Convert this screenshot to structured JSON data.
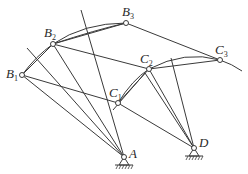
{
  "diagram": {
    "title": "",
    "type": "four-bar linkage synthesis (three coupler positions)",
    "labels": {
      "B1": {
        "letter": "B",
        "sub": "1"
      },
      "B2": {
        "letter": "B",
        "sub": "2"
      },
      "B3": {
        "letter": "B",
        "sub": "3"
      },
      "C1": {
        "letter": "C",
        "sub": "1"
      },
      "C2": {
        "letter": "C",
        "sub": "2"
      },
      "C3": {
        "letter": "C",
        "sub": "3"
      },
      "A": {
        "letter": "A",
        "sub": ""
      },
      "D": {
        "letter": "D",
        "sub": ""
      }
    },
    "points": {
      "B1": [
        22,
        75
      ],
      "B2": [
        53,
        44
      ],
      "B3": [
        126,
        23
      ],
      "C1": [
        118,
        103
      ],
      "C2": [
        149,
        69
      ],
      "C3": [
        220,
        60
      ],
      "A": [
        124,
        157
      ],
      "D": [
        194,
        148
      ]
    },
    "fixed_pivots": [
      "A",
      "D"
    ],
    "moving_joints": [
      "B1",
      "B2",
      "B3",
      "C1",
      "C2",
      "C3"
    ],
    "line_color": "#3a3a3a"
  }
}
